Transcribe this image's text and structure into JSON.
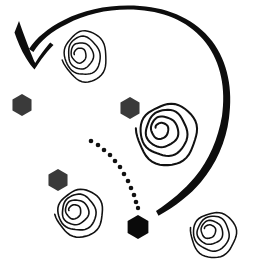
{
  "canvas": {
    "width": 255,
    "height": 267,
    "background_color": "#ffffff",
    "title": "Curved arrow sweeping over spirals and hexagons",
    "style": "hand-drawn black ink sketch"
  },
  "palette": {
    "ink_black": "#111111",
    "arrow_black": "#0d0d0d",
    "hex_dark_gray": "#3a3a3a",
    "hex_black": "#0a0a0a",
    "dot_black": "#111111",
    "background": "#ffffff"
  },
  "chart_data": {
    "type": "scatter",
    "xlabel": "",
    "ylabel": "",
    "xlim": [
      0,
      255
    ],
    "ylim": [
      0,
      267
    ],
    "grid": false,
    "legend": "none",
    "series": [
      {
        "name": "spirals",
        "marker": "spiral",
        "values": [
          {
            "id": "spiral-top",
            "x": 86,
            "y": 55,
            "rx": 24,
            "ry": 28,
            "turns": 4,
            "rotation": -12
          },
          {
            "id": "spiral-center-right",
            "x": 169,
            "y": 133,
            "rx": 33,
            "ry": 34,
            "turns": 4,
            "rotation": 8
          },
          {
            "id": "spiral-bottom-left",
            "x": 81,
            "y": 212,
            "rx": 26,
            "ry": 26,
            "turns": 4,
            "rotation": -5
          },
          {
            "id": "spiral-bottom-right",
            "x": 215,
            "y": 234,
            "rx": 25,
            "ry": 25,
            "turns": 4,
            "rotation": 15
          }
        ]
      },
      {
        "name": "hexagons",
        "marker": "hexagon",
        "values": [
          {
            "id": "hex-left",
            "x": 22,
            "y": 105,
            "size": 11,
            "color": "#3a3a3a"
          },
          {
            "id": "hex-mid",
            "x": 130,
            "y": 108,
            "size": 11,
            "color": "#3a3a3a"
          },
          {
            "id": "hex-lower-left",
            "x": 58,
            "y": 180,
            "size": 11,
            "color": "#3a3a3a"
          },
          {
            "id": "hex-bottom",
            "x": 138,
            "y": 227,
            "size": 12,
            "color": "#0a0a0a"
          }
        ]
      },
      {
        "name": "dotted-arc",
        "marker": "dot",
        "values": [
          {
            "x": 91,
            "y": 141,
            "r": 2.3
          },
          {
            "x": 98,
            "y": 145,
            "r": 2.3
          },
          {
            "x": 104,
            "y": 150,
            "r": 2.3
          },
          {
            "x": 110,
            "y": 155,
            "r": 2.3
          },
          {
            "x": 115,
            "y": 161,
            "r": 2.3
          },
          {
            "x": 120,
            "y": 167,
            "r": 2.3
          },
          {
            "x": 124,
            "y": 174,
            "r": 2.3
          },
          {
            "x": 128,
            "y": 181,
            "r": 2.3
          },
          {
            "x": 131,
            "y": 188,
            "r": 2.3
          },
          {
            "x": 134,
            "y": 195,
            "r": 2.3
          },
          {
            "x": 136,
            "y": 202,
            "r": 2.3
          },
          {
            "x": 138,
            "y": 208,
            "r": 2.2
          }
        ]
      }
    ],
    "annotations": [
      {
        "id": "sweep-arrow",
        "type": "curved-arrow",
        "direction": "counter-clockwise",
        "start": {
          "x": 158,
          "y": 216
        },
        "end": {
          "x": 28,
          "y": 62
        },
        "arrowhead": "v-shaped",
        "arrowhead_at": "end"
      }
    ]
  },
  "figure": {
    "label": "spiral-hexagon-sketch",
    "element_names": {
      "arrow": "sweep-arrow",
      "arrowhead": "arrowhead",
      "dots": "dotted-arc",
      "hexagons": "hexagon-markers",
      "spirals": "spiral-markers"
    },
    "counts": {
      "spirals": "4",
      "hexagons": "4",
      "dots": "12"
    }
  }
}
